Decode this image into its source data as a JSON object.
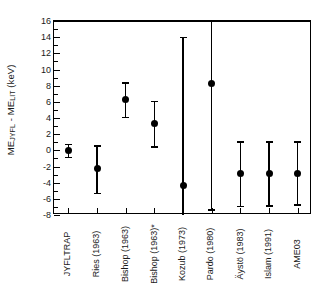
{
  "chart_data": {
    "type": "scatter",
    "title": "",
    "xlabel": "",
    "ylabel_text": "ME_JYFL - ME_LIT (keV)",
    "ylabel_parts": {
      "m1": "ME",
      "s1": "JYFL",
      "dash": " - ",
      "m2": "ME",
      "s2": "LIT",
      "units": " (keV)"
    },
    "ylim": [
      -8,
      16
    ],
    "ytick_labels": [
      "16",
      "14",
      "12",
      "10",
      "8",
      "6",
      "4",
      "2",
      "0",
      "-2",
      "-4",
      "-6",
      "-8"
    ],
    "ytick_values": [
      16,
      14,
      12,
      10,
      8,
      6,
      4,
      2,
      0,
      -2,
      -4,
      -6,
      -8
    ],
    "grid": false,
    "legend": null,
    "zero_reference_line": 0,
    "categories": [
      "JYFLTRAP",
      "Ries (1963)",
      "Bishop (1963)",
      "Bishop (1963)*",
      "Kozub (1973)",
      "Pardo (1980)",
      "Äystö (1983)",
      "Islam (1991)",
      "AME03"
    ],
    "values": [
      0.0,
      -2.2,
      6.3,
      3.3,
      -4.4,
      8.3,
      -2.85,
      -2.85,
      -2.85
    ],
    "err_upper": [
      0.8,
      2.8,
      2.1,
      2.8,
      18.4,
      7.7,
      3.95,
      3.95,
      3.95
    ],
    "err_lower": [
      0.8,
      3.1,
      2.2,
      2.8,
      5.6,
      15.6,
      4.05,
      3.95,
      3.85
    ],
    "points": [
      {
        "label": "JYFLTRAP",
        "y": 0.0,
        "low": -0.8,
        "high": 0.8,
        "capped_low": true,
        "capped_high": true
      },
      {
        "label": "Ries (1963)",
        "y": -2.2,
        "low": -5.3,
        "high": 0.6,
        "capped_low": true,
        "capped_high": true
      },
      {
        "label": "Bishop (1963)",
        "y": 6.3,
        "low": 4.1,
        "high": 8.4,
        "capped_low": true,
        "capped_high": true
      },
      {
        "label": "Bishop (1963)*",
        "y": 3.3,
        "low": 0.5,
        "high": 6.1,
        "capped_low": true,
        "capped_high": true
      },
      {
        "label": "Kozub (1973)",
        "y": -4.4,
        "low": -8.0,
        "high": 14.0,
        "capped_low": false,
        "capped_high": true
      },
      {
        "label": "Pardo (1980)",
        "y": 8.3,
        "low": -7.3,
        "high": 16.0,
        "capped_low": true,
        "capped_high": false
      },
      {
        "label": "Äystö (1983)",
        "y": -2.85,
        "low": -6.9,
        "high": 1.1,
        "capped_low": true,
        "capped_high": true
      },
      {
        "label": "Islam (1991)",
        "y": -2.85,
        "low": -6.8,
        "high": 1.1,
        "capped_low": true,
        "capped_high": true
      },
      {
        "label": "AME03",
        "y": -2.85,
        "low": -6.7,
        "high": 1.1,
        "capped_low": true,
        "capped_high": true
      }
    ],
    "colors": {
      "marker": "#000000",
      "errorbar": "#000000",
      "axis": "#000000",
      "background": "#ffffff"
    }
  }
}
